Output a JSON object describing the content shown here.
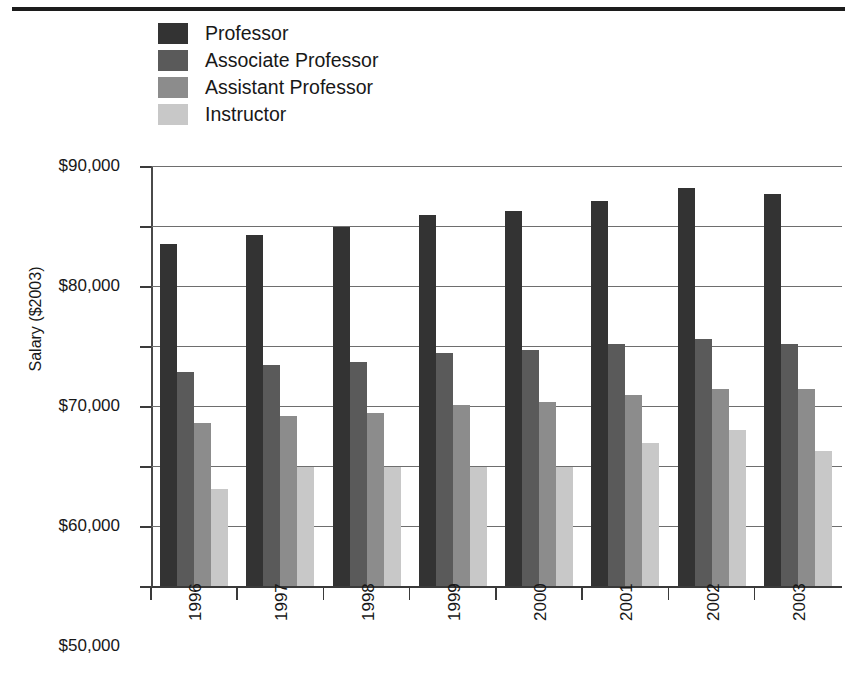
{
  "figure": {
    "background_color": "#ffffff",
    "rule_color": "#1c1c1c"
  },
  "legend": {
    "position": "top-center",
    "items": [
      {
        "label": "Professor",
        "color": "#333333"
      },
      {
        "label": "Associate Professor",
        "color": "#5a5a5a"
      },
      {
        "label": "Assistant Professor",
        "color": "#8c8c8c"
      },
      {
        "label": "Instructor",
        "color": "#c8c8c8"
      }
    ]
  },
  "axes": {
    "y_title": "Salary ($2003)",
    "y_tick_labels": [
      "$90,000",
      "$80,000",
      "$70,000",
      "$60,000",
      "$50,000",
      "$40,000",
      "$30,000",
      "$20,000"
    ],
    "x_tick_labels": [
      "1996",
      "1997",
      "1998",
      "1999",
      "2000",
      "2001",
      "2002",
      "2003"
    ]
  },
  "chart_data": {
    "type": "bar",
    "title": "",
    "subtitle": "",
    "xlabel": "",
    "ylabel": "Salary ($2003)",
    "categories": [
      "1996",
      "1997",
      "1998",
      "1999",
      "2000",
      "2001",
      "2002",
      "2003"
    ],
    "series": [
      {
        "name": "Professor",
        "color": "#333333",
        "values": [
          77000,
          78500,
          79800,
          81800,
          82500,
          84200,
          86300,
          85300
        ]
      },
      {
        "name": "Associate Professor",
        "color": "#5a5a5a",
        "values": [
          55600,
          56800,
          57300,
          58900,
          59400,
          60400,
          61200,
          60300
        ]
      },
      {
        "name": "Assistant Professor",
        "color": "#8c8c8c",
        "values": [
          47200,
          48300,
          48900,
          50200,
          50700,
          51800,
          52800,
          52800
        ]
      },
      {
        "name": "Instructor",
        "color": "#c8c8c8",
        "values": [
          36200,
          39800,
          39800,
          39800,
          39800,
          43800,
          46000,
          42500
        ]
      }
    ],
    "ylim": [
      20000,
      90000
    ],
    "ytick_step": 10000,
    "grid": true,
    "legend_position": "top-center",
    "value_prefix": "$"
  }
}
